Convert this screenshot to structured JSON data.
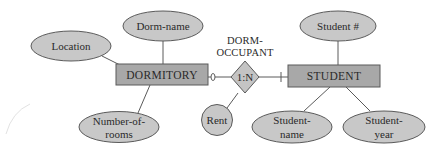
{
  "diagram": {
    "type": "entity-relationship",
    "colors": {
      "entity_fill": "#a8a8a8",
      "attribute_fill": "#c8c8c8",
      "relationship_fill": "#c4c4c4",
      "stroke": "#5a5a5a",
      "text": "#2a2a2a"
    },
    "relationship": {
      "name_line1": "DORM-",
      "name_line2": "OCCUPANT",
      "cardinality": "1:N",
      "attribute": "Rent"
    },
    "entities": {
      "dormitory": {
        "label": "DORMITORY",
        "attributes": {
          "location": "Location",
          "dorm_name": "Dorm-name",
          "number_of_rooms_line1": "Number-of-",
          "number_of_rooms_line2": "rooms"
        },
        "participation": "optional (zero)"
      },
      "student": {
        "label": "STUDENT",
        "attributes": {
          "student_id": "Student #",
          "student_name_line1": "Student-",
          "student_name_line2": "name",
          "student_year_line1": "Student-",
          "student_year_line2": "year"
        },
        "participation": "mandatory (one)"
      }
    }
  }
}
